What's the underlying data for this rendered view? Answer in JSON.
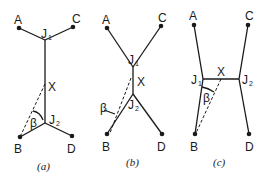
{
  "figure": {
    "panels": [
      {
        "caption": "(a)",
        "taxa": {
          "A": "A",
          "B": "B",
          "C": "C",
          "D": "D"
        },
        "junction_1": "J",
        "junction_1_sub": "1",
        "junction_2": "J",
        "junction_2_sub": "2",
        "branch_label": "X",
        "angle_label": "β"
      },
      {
        "caption": "(b)",
        "taxa": {
          "A": "A",
          "B": "B",
          "C": "C",
          "D": "D"
        },
        "junction_1": "J",
        "junction_1_sub": "1",
        "junction_2": "J",
        "junction_2_sub": "2",
        "branch_label": "X",
        "angle_label": "β"
      },
      {
        "caption": "(c)",
        "taxa": {
          "A": "A",
          "B": "B",
          "C": "C",
          "D": "D"
        },
        "junction_1": "J",
        "junction_1_sub": "1",
        "junction_2": "J",
        "junction_2_sub": "2",
        "branch_label": "X",
        "angle_label": "β"
      }
    ]
  }
}
